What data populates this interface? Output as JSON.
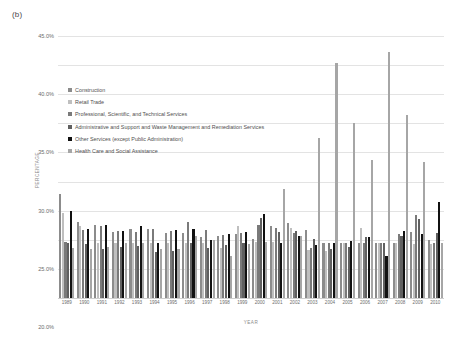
{
  "panel_label": "(b)",
  "chart_data": {
    "type": "bar",
    "title": "(b)",
    "xlabel": "YEAR",
    "ylabel": "PERCENTAGE",
    "ylim": [
      0,
      45
    ],
    "ytick_labels": [
      "45.0%",
      "40.0%",
      "35.0%",
      "30.0%",
      "25.0%",
      "20.0%",
      "15.0%",
      "10.0%",
      "5.0%",
      "0.0%"
    ],
    "ytick_values": [
      45,
      40,
      35,
      30,
      25,
      20,
      15,
      10,
      5,
      0
    ],
    "grid": true,
    "legend_position": "upper-left-inside",
    "categories": [
      "1989",
      "1990",
      "1991",
      "1992",
      "1993",
      "1994",
      "1995",
      "1996",
      "1997",
      "1998",
      "1999",
      "2000",
      "2001",
      "2002",
      "2003",
      "2004",
      "2005",
      "2006",
      "2007",
      "2008",
      "2009",
      "2010"
    ],
    "series": [
      {
        "name": "Construction",
        "color": "#8c8c8c",
        "values": [
          17.8,
          13.0,
          12.6,
          11.4,
          11.9,
          11.9,
          11.2,
          11.2,
          10.5,
          10.6,
          11.0,
          10.2,
          12.4,
          12.8,
          11.6,
          9.4,
          9.5,
          9.5,
          9.5,
          9.4,
          11.3,
          10.0
        ]
      },
      {
        "name": "Retail Trade",
        "color": "#bfbfbf",
        "values": [
          14.6,
          12.3,
          9.5,
          9.4,
          9.4,
          9.4,
          9.4,
          9.5,
          9.4,
          8.6,
          12.4,
          9.6,
          9.6,
          12.0,
          8.2,
          8.1,
          9.5,
          12.0,
          9.5,
          9.4,
          9.2,
          9.2
        ]
      },
      {
        "name": "Professional, Scientific, and Technical Services",
        "color": "#7a7a7a",
        "values": [
          9.6,
          11.7,
          12.3,
          11.5,
          11.4,
          11.9,
          11.5,
          13.1,
          11.7,
          10.8,
          11.2,
          12.6,
          12.0,
          11.1,
          8.6,
          9.4,
          9.5,
          9.4,
          9.4,
          11.0,
          14.2,
          9.4
        ]
      },
      {
        "name": "Administrative and Support and Waste Management and Remediation Services",
        "color": "#606060",
        "values": [
          9.4,
          9.3,
          8.4,
          8.8,
          8.9,
          7.9,
          8.0,
          9.5,
          8.6,
          9.1,
          9.4,
          13.7,
          11.4,
          11.5,
          10.1,
          8.5,
          8.8,
          10.4,
          9.5,
          10.6,
          13.6,
          11.2
        ]
      },
      {
        "name": "Other Services (except Public Administration)",
        "color": "#111111",
        "values": [
          14.9,
          11.8,
          12.5,
          11.5,
          12.4,
          9.5,
          11.6,
          11.9,
          9.9,
          11.0,
          11.3,
          14.5,
          9.5,
          10.6,
          9.1,
          9.5,
          9.8,
          10.4,
          7.3,
          11.5,
          11.0,
          16.5
        ]
      },
      {
        "name": "Health Care and Social Assistance",
        "color": "#a6a6a6",
        "values": [
          8.6,
          8.4,
          8.7,
          9.4,
          9.5,
          8.4,
          8.5,
          10.6,
          10.0,
          7.3,
          9.3,
          9.7,
          18.8,
          10.7,
          27.5,
          40.4,
          30.0,
          23.7,
          42.2,
          31.4,
          23.4,
          9.4
        ]
      }
    ]
  }
}
